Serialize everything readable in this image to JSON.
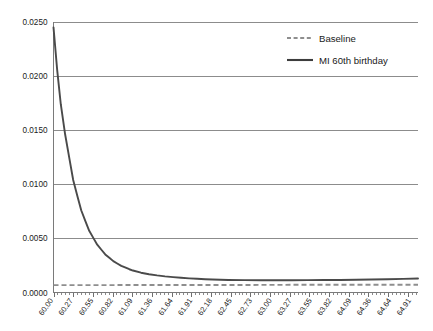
{
  "chart_data": {
    "type": "line",
    "title": "",
    "xlabel": "",
    "ylabel": "",
    "xlim": [
      60.0,
      65.0
    ],
    "ylim": [
      0.0,
      0.025
    ],
    "grid": true,
    "legend_position": "top-right",
    "y_ticks": [
      "0.0000",
      "0.0050",
      "0.0100",
      "0.0150",
      "0.0200",
      "0.0250"
    ],
    "y_tick_values": [
      0.0,
      0.005,
      0.01,
      0.015,
      0.02,
      0.025
    ],
    "x_tick_labels": [
      "60.00",
      "60.27",
      "60.55",
      "60.82",
      "61.09",
      "61.36",
      "61.64",
      "61.91",
      "62.18",
      "62.45",
      "62.73",
      "63.00",
      "63.27",
      "63.55",
      "63.82",
      "64.09",
      "64.36",
      "64.64",
      "64.91"
    ],
    "x_tick_values": [
      60.0,
      60.27,
      60.55,
      60.82,
      61.09,
      61.36,
      61.64,
      61.91,
      62.18,
      62.45,
      62.73,
      63.0,
      63.27,
      63.55,
      63.82,
      64.09,
      64.36,
      64.64,
      64.91
    ],
    "minor_ticks_per_label": 5,
    "series": [
      {
        "name": "Baseline",
        "style": "dashed",
        "color": "#8e8e8e",
        "x": [
          60.0,
          60.55,
          61.09,
          61.64,
          62.18,
          62.73,
          63.27,
          63.82,
          64.36,
          64.91,
          65.0
        ],
        "values": [
          0.00068,
          0.00068,
          0.00069,
          0.00069,
          0.0007,
          0.0007,
          0.00071,
          0.00071,
          0.00072,
          0.00072,
          0.00072
        ]
      },
      {
        "name": "MI 60th birthday",
        "style": "solid",
        "color": "#4a4a4a",
        "x": [
          60.0,
          60.05,
          60.1,
          60.16,
          60.22,
          60.27,
          60.33,
          60.38,
          60.44,
          60.49,
          60.55,
          60.6,
          60.66,
          60.71,
          60.77,
          60.82,
          60.88,
          60.93,
          60.99,
          61.04,
          61.09,
          61.2,
          61.31,
          61.42,
          61.53,
          61.64,
          61.75,
          61.86,
          61.97,
          62.08,
          62.18,
          62.4,
          62.62,
          62.84,
          63.06,
          63.27,
          63.49,
          63.71,
          63.93,
          64.15,
          64.36,
          64.58,
          64.8,
          65.0
        ],
        "values": [
          0.0245,
          0.0206,
          0.0174,
          0.0146,
          0.0123,
          0.0104,
          0.00885,
          0.0076,
          0.00655,
          0.0057,
          0.005,
          0.00442,
          0.00393,
          0.00352,
          0.00318,
          0.0029,
          0.00266,
          0.00246,
          0.00229,
          0.00215,
          0.00203,
          0.00183,
          0.00169,
          0.00158,
          0.00149,
          0.00142,
          0.00136,
          0.00131,
          0.00127,
          0.00123,
          0.0012,
          0.00116,
          0.00114,
          0.00113,
          0.00113,
          0.00113,
          0.00114,
          0.00115,
          0.00116,
          0.00118,
          0.0012,
          0.00123,
          0.00126,
          0.00129
        ]
      }
    ]
  },
  "legend": {
    "items": [
      {
        "label": "Baseline",
        "style": "dashed"
      },
      {
        "label": "MI 60th birthday",
        "style": "solid"
      }
    ]
  }
}
